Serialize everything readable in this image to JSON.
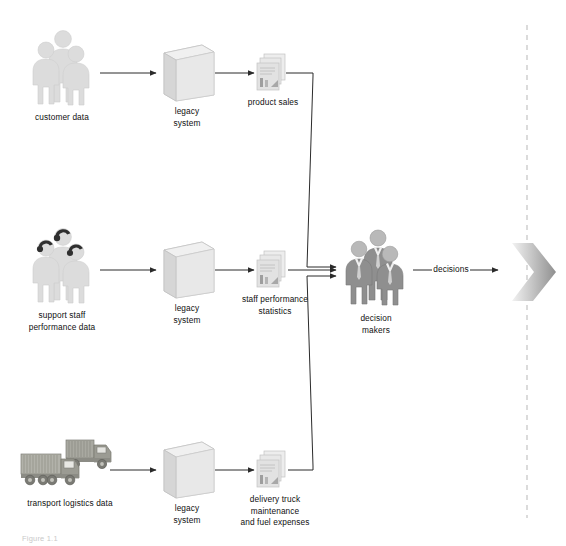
{
  "diagram": {
    "type": "flow-diagram",
    "rows": [
      {
        "id": "customer",
        "source_label": "customer data",
        "source_icon": "people-group-icon",
        "process_label": "legacy\nsystem",
        "process_icon": "3d-box-icon",
        "output_label": "product sales",
        "output_icon": "document-stack-icon"
      },
      {
        "id": "support-staff",
        "source_label": "support staff\nperformance data",
        "source_icon": "headset-people-group-icon",
        "process_label": "legacy\nsystem",
        "process_icon": "3d-box-icon",
        "output_label": "staff performance\nstatistics",
        "output_icon": "document-stack-icon"
      },
      {
        "id": "transport",
        "source_label": "transport logistics data",
        "source_icon": "container-trucks-icon",
        "process_label": "legacy\nsystem",
        "process_icon": "3d-box-icon",
        "output_label": "delivery truck\nmaintenance\nand fuel expenses",
        "output_icon": "document-stack-icon"
      }
    ],
    "consumer": {
      "label": "decision\nmakers",
      "icon": "businesspeople-group-icon"
    },
    "outcome": {
      "label": "decisions",
      "icon": "chevron-arrow-icon"
    },
    "boundary": {
      "name": "dashed-boundary-line",
      "style": "dashed-vertical"
    },
    "figure_caption": "Figure 1.1",
    "colors": {
      "line": "#2b2b2b",
      "people_light": "#d8d8d8",
      "people_mid": "#9a9a9a",
      "box_face": "#eeeeee",
      "box_side": "#d4d4d4",
      "doc": "#e2e2e2",
      "truck": "#9b9b93",
      "chevron": "#b4b4b4",
      "dash": "#c8c8c8",
      "text": "#101010"
    }
  }
}
